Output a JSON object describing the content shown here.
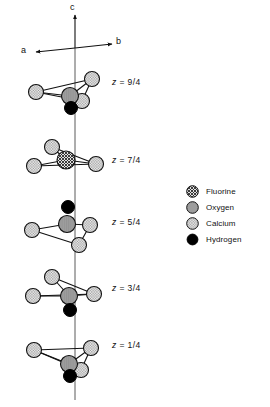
{
  "figure": {
    "background_color": "#ffffff",
    "line_color": "#111111"
  },
  "axes": {
    "c": {
      "label": "c",
      "x": 72,
      "y": 6
    },
    "a": {
      "label": "a",
      "x": 22,
      "y": 43
    },
    "b": {
      "label": "b",
      "x": 118,
      "y": 43
    },
    "origin": {
      "x": 75,
      "y": 48
    }
  },
  "legend": {
    "items": [
      {
        "label": "Fluorine",
        "pattern": "crosshatch",
        "fill": "#d9d9d9",
        "stroke": "#111111"
      },
      {
        "label": "Oxygen",
        "pattern": "solid",
        "fill": "#9a9a9a",
        "stroke": "#111111"
      },
      {
        "label": "Calcium",
        "pattern": "stipple",
        "fill": "#e6e6e6",
        "stroke": "#111111"
      },
      {
        "label": "Hydrogen",
        "pattern": "black",
        "fill": "#000000",
        "stroke": "#000000"
      }
    ]
  },
  "z_labels": [
    {
      "text": "z = 9/4",
      "var": "z",
      "value": "9/4",
      "x": 112,
      "y": 77
    },
    {
      "text": "z = 7/4",
      "var": "z",
      "value": "7/4",
      "x": 112,
      "y": 155
    },
    {
      "text": "z = 5/4",
      "var": "z",
      "value": "5/4",
      "x": 112,
      "y": 217
    },
    {
      "text": "z = 3/4",
      "var": "z",
      "value": "3/4",
      "x": 112,
      "y": 283
    },
    {
      "text": "z = 1/4",
      "var": "z",
      "value": "1/4",
      "x": 112,
      "y": 340
    }
  ],
  "c_axis_line": {
    "x": 75,
    "y_top": 48,
    "y_bottom": 400
  },
  "clusters": [
    {
      "id": "z-9-4",
      "z": "9/4",
      "atoms": [
        {
          "name": "calcium-left",
          "element": "Calcium",
          "cx": 36,
          "cy": 92,
          "r": 7.5
        },
        {
          "name": "calcium-upper-right",
          "element": "Calcium",
          "cx": 92,
          "cy": 79,
          "r": 7.5
        },
        {
          "name": "oxygen-center",
          "element": "Oxygen",
          "cx": 70,
          "cy": 96,
          "r": 8.5
        },
        {
          "name": "calcium-lower-right",
          "element": "Calcium",
          "cx": 82,
          "cy": 101,
          "r": 7.5
        },
        {
          "name": "hydrogen-bottom",
          "element": "Hydrogen",
          "cx": 71,
          "cy": 108,
          "r": 6.5
        }
      ],
      "bonds": [
        {
          "from": "calcium-left",
          "to": "calcium-upper-right"
        },
        {
          "from": "calcium-left",
          "to": "oxygen-center"
        },
        {
          "from": "calcium-left",
          "to": "calcium-lower-right"
        },
        {
          "from": "oxygen-center",
          "to": "calcium-upper-right"
        },
        {
          "from": "calcium-lower-right",
          "to": "calcium-upper-right"
        }
      ]
    },
    {
      "id": "z-7-4",
      "z": "7/4",
      "atoms": [
        {
          "name": "calcium-upper-left",
          "element": "Calcium",
          "cx": 52,
          "cy": 147,
          "r": 7.5
        },
        {
          "name": "fluorine-center",
          "element": "Fluorine",
          "cx": 66,
          "cy": 160,
          "r": 9.0
        },
        {
          "name": "calcium-lower-left",
          "element": "Calcium",
          "cx": 34,
          "cy": 166,
          "r": 7.5
        },
        {
          "name": "calcium-right",
          "element": "Calcium",
          "cx": 96,
          "cy": 164,
          "r": 7.5
        }
      ],
      "bonds": [
        {
          "from": "calcium-upper-left",
          "to": "calcium-right"
        },
        {
          "from": "calcium-upper-left",
          "to": "fluorine-center"
        },
        {
          "from": "calcium-lower-left",
          "to": "fluorine-center"
        },
        {
          "from": "calcium-lower-left",
          "to": "calcium-right"
        },
        {
          "from": "fluorine-center",
          "to": "calcium-right"
        }
      ]
    },
    {
      "id": "z-5-4",
      "z": "5/4",
      "atoms": [
        {
          "name": "hydrogen-top",
          "element": "Hydrogen",
          "cx": 68,
          "cy": 207,
          "r": 6.5
        },
        {
          "name": "oxygen-center",
          "element": "Oxygen",
          "cx": 67,
          "cy": 224,
          "r": 8.5
        },
        {
          "name": "calcium-left",
          "element": "Calcium",
          "cx": 32,
          "cy": 230,
          "r": 7.5
        },
        {
          "name": "calcium-right",
          "element": "Calcium",
          "cx": 90,
          "cy": 225,
          "r": 7.5
        },
        {
          "name": "calcium-lower-right",
          "element": "Calcium",
          "cx": 79,
          "cy": 245,
          "r": 7.5
        }
      ],
      "bonds": [
        {
          "from": "calcium-left",
          "to": "oxygen-center"
        },
        {
          "from": "calcium-left",
          "to": "calcium-lower-right"
        },
        {
          "from": "oxygen-center",
          "to": "calcium-right"
        },
        {
          "from": "calcium-right",
          "to": "calcium-lower-right"
        }
      ]
    },
    {
      "id": "z-3-4",
      "z": "3/4",
      "atoms": [
        {
          "name": "calcium-upper-left",
          "element": "Calcium",
          "cx": 52,
          "cy": 277,
          "r": 7.5
        },
        {
          "name": "calcium-left",
          "element": "Calcium",
          "cx": 33,
          "cy": 296,
          "r": 7.5
        },
        {
          "name": "oxygen-center",
          "element": "Oxygen",
          "cx": 69,
          "cy": 296,
          "r": 8.5
        },
        {
          "name": "calcium-right",
          "element": "Calcium",
          "cx": 94,
          "cy": 294,
          "r": 7.5
        },
        {
          "name": "hydrogen-bottom",
          "element": "Hydrogen",
          "cx": 70,
          "cy": 310,
          "r": 6.5
        }
      ],
      "bonds": [
        {
          "from": "calcium-upper-left",
          "to": "calcium-right"
        },
        {
          "from": "calcium-upper-left",
          "to": "oxygen-center"
        },
        {
          "from": "calcium-left",
          "to": "oxygen-center"
        },
        {
          "from": "calcium-left",
          "to": "calcium-right"
        },
        {
          "from": "oxygen-center",
          "to": "calcium-right"
        }
      ]
    },
    {
      "id": "z-1-4",
      "z": "1/4",
      "atoms": [
        {
          "name": "calcium-left",
          "element": "Calcium",
          "cx": 34,
          "cy": 350,
          "r": 7.5
        },
        {
          "name": "calcium-upper-right",
          "element": "Calcium",
          "cx": 91,
          "cy": 348,
          "r": 7.5
        },
        {
          "name": "oxygen-center",
          "element": "Oxygen",
          "cx": 69,
          "cy": 364,
          "r": 8.5
        },
        {
          "name": "calcium-lower-right",
          "element": "Calcium",
          "cx": 81,
          "cy": 370,
          "r": 7.5
        },
        {
          "name": "hydrogen-bottom",
          "element": "Hydrogen",
          "cx": 70,
          "cy": 376,
          "r": 6.5
        }
      ],
      "bonds": [
        {
          "from": "calcium-left",
          "to": "calcium-upper-right"
        },
        {
          "from": "calcium-left",
          "to": "oxygen-center"
        },
        {
          "from": "calcium-left",
          "to": "calcium-lower-right"
        },
        {
          "from": "oxygen-center",
          "to": "calcium-upper-right"
        },
        {
          "from": "calcium-lower-right",
          "to": "calcium-upper-right"
        }
      ]
    }
  ]
}
